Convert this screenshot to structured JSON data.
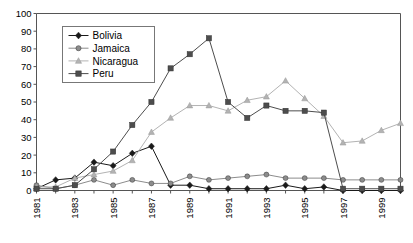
{
  "chart_data": {
    "type": "line",
    "title": "",
    "xlabel": "",
    "ylabel": "",
    "ylim": [
      0,
      100
    ],
    "ytick_step": 10,
    "yticks": [
      "0",
      "10",
      "20",
      "30",
      "40",
      "50",
      "60",
      "70",
      "80",
      "90",
      "100"
    ],
    "grid": false,
    "legend_position": "top-left-inside",
    "x": [
      1981,
      1982,
      1983,
      1984,
      1985,
      1986,
      1987,
      1988,
      1989,
      1990,
      1991,
      1992,
      1993,
      1994,
      1995,
      1996,
      1997,
      1998,
      1999,
      2000
    ],
    "xtick_labels_shown": [
      "1981",
      "1983",
      "1985",
      "1987",
      "1989",
      "1991",
      "1993",
      "1995",
      "1997",
      "1999"
    ],
    "series": [
      {
        "name": "Bolivia",
        "marker": "diamond",
        "color": "#1a1a1a",
        "values": [
          1,
          6,
          7,
          16,
          14,
          21,
          25,
          3,
          3,
          1,
          1,
          1,
          1,
          3,
          1,
          2,
          0,
          0,
          0,
          0
        ]
      },
      {
        "name": "Jamaica",
        "marker": "circle",
        "color": "#8c8c8c",
        "values": [
          3,
          1,
          3,
          6,
          3,
          6,
          4,
          4,
          8,
          6,
          7,
          8,
          9,
          7,
          7,
          7,
          6,
          6,
          6,
          6
        ]
      },
      {
        "name": "Nicaragua",
        "marker": "triangle",
        "color": "#b3b3b3",
        "values": [
          2,
          2,
          7,
          9,
          11,
          17,
          33,
          41,
          48,
          48,
          45,
          51,
          53,
          62,
          52,
          42,
          27,
          28,
          34,
          38
        ]
      },
      {
        "name": "Peru",
        "marker": "square",
        "color": "#4d4d4d",
        "values": [
          1,
          1,
          3,
          12,
          22,
          37,
          50,
          69,
          77,
          86,
          50,
          41,
          48,
          45,
          45,
          44,
          1,
          1,
          1,
          1
        ]
      }
    ]
  },
  "legend": {
    "items": [
      {
        "label": "Bolivia"
      },
      {
        "label": "Jamaica"
      },
      {
        "label": "Nicaragua"
      },
      {
        "label": "Peru"
      }
    ]
  }
}
